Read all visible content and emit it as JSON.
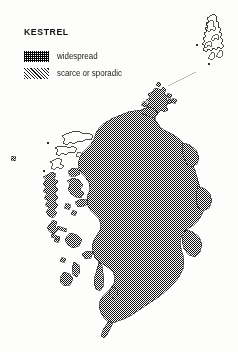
{
  "figure": {
    "title": "KESTREL",
    "kind": "species distribution map",
    "region": "Scotland",
    "background_color": "#fdfdfc",
    "ink_color": "#111111"
  },
  "legend": {
    "items": [
      {
        "label": "widespread",
        "pattern": "dense-checker-fill",
        "swatch_class": "pat-widespread"
      },
      {
        "label": "scarce or sporadic",
        "pattern": "diagonal-hatch-fill",
        "swatch_class": "pat-scarce"
      }
    ]
  },
  "map": {
    "areas": [
      {
        "name": "scottish-mainland",
        "fill": "widespread"
      },
      {
        "name": "orkney-islands",
        "fill": "widespread"
      },
      {
        "name": "shetland-islands",
        "fill": "none"
      },
      {
        "name": "outer-hebrides-north",
        "fill": "none"
      },
      {
        "name": "outer-hebrides-south",
        "fill": "widespread"
      },
      {
        "name": "inner-hebrides",
        "fill": "widespread"
      },
      {
        "name": "st-kilda-mark",
        "fill": "widespread"
      }
    ],
    "inset_divider": "shetland-inset-line"
  }
}
